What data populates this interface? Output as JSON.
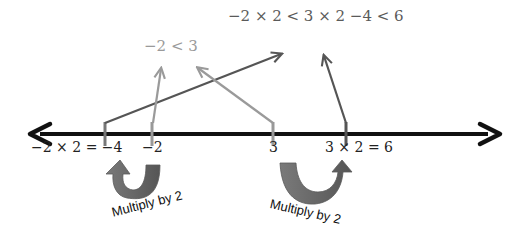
{
  "top_inequality": "−2 × 2 < 3 × 2 −4 < 6",
  "small_inequality": "−2 < 3",
  "number_line": {
    "labels": [
      {
        "id": "neg4",
        "text": "−2 × 2 = −4"
      },
      {
        "id": "neg2",
        "text": "−2"
      },
      {
        "id": "three",
        "text": "3"
      },
      {
        "id": "six",
        "text": "3 × 2 = 6"
      }
    ]
  },
  "curved_arrows": [
    {
      "label": "Multiply by 2"
    },
    {
      "label": "Multiply by 2"
    }
  ],
  "colors": {
    "line": "#111111",
    "dark_arrow": "#555555",
    "light_arrow": "#9a9a9a",
    "curved_arrow": "#6a6a6a"
  }
}
